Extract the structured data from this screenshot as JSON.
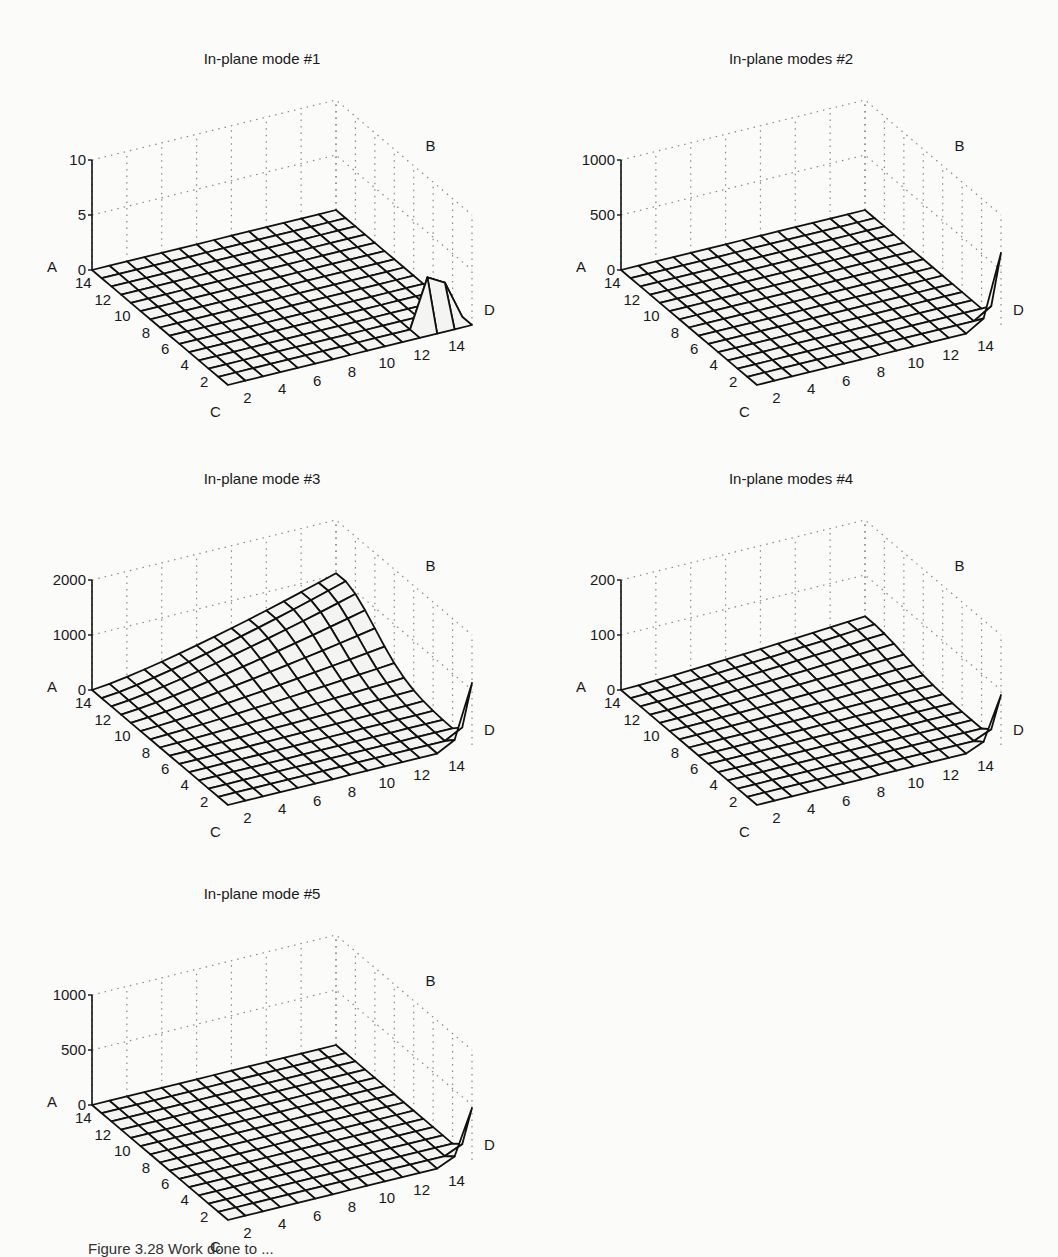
{
  "figure": {
    "caption": "Figure 3.28  Work done to ..."
  },
  "chart_data": [
    {
      "type": "surface",
      "title": "In-plane mode #1",
      "axes": {
        "corner_labels": [
          "A",
          "B",
          "C",
          "D"
        ],
        "x_ticks": [
          2,
          4,
          6,
          8,
          10,
          12,
          14
        ],
        "y_ticks": [
          2,
          4,
          6,
          8,
          10,
          12,
          14
        ],
        "z_ticks": [
          0,
          5,
          10
        ],
        "zlim": [
          0,
          10
        ]
      },
      "grid_size": 15,
      "surface": "flat ~0 everywhere; sharp triangular peak (~4) near x=12-13, y=13-14 (corner D)",
      "peak": {
        "x": 12.5,
        "y": 13,
        "z": 4
      },
      "grid": "dotted"
    },
    {
      "type": "surface",
      "title": "In-plane modes #2",
      "axes": {
        "corner_labels": [
          "A",
          "B",
          "C",
          "D"
        ],
        "x_ticks": [
          2,
          4,
          6,
          8,
          10,
          12,
          14
        ],
        "y_ticks": [
          2,
          4,
          6,
          8,
          10,
          12,
          14
        ],
        "z_ticks": [
          0,
          500,
          1000
        ],
        "zlim": [
          0,
          1000
        ]
      },
      "grid_size": 15,
      "surface": "flat ~0; single thin spike (~450) at corner x=14, y=14",
      "peak": {
        "x": 14,
        "y": 14,
        "z": 450
      },
      "grid": "dotted"
    },
    {
      "type": "surface",
      "title": "In-plane mode #3",
      "axes": {
        "corner_labels": [
          "A",
          "B",
          "C",
          "D"
        ],
        "x_ticks": [
          2,
          4,
          6,
          8,
          10,
          12,
          14
        ],
        "y_ticks": [
          2,
          4,
          6,
          8,
          10,
          12,
          14
        ],
        "z_ticks": [
          0,
          1000,
          2000
        ],
        "zlim": [
          0,
          2000
        ]
      },
      "grid_size": 15,
      "surface": "smooth hump rising toward B edge (~600) with ridge ~800 near back corner; spike (~900) at corner D",
      "peak": {
        "x": 14,
        "y": 14,
        "z": 900
      },
      "grid": "dotted"
    },
    {
      "type": "surface",
      "title": "In-plane modes #4",
      "axes": {
        "corner_labels": [
          "A",
          "B",
          "C",
          "D"
        ],
        "x_ticks": [
          2,
          4,
          6,
          8,
          10,
          12,
          14
        ],
        "y_ticks": [
          2,
          4,
          6,
          8,
          10,
          12,
          14
        ],
        "z_ticks": [
          0,
          100,
          200
        ],
        "zlim": [
          0,
          200
        ]
      },
      "grid_size": 15,
      "surface": "nearly flat; mild hump near B (~20); spike (~50) at corner D",
      "peak": {
        "x": 14,
        "y": 14,
        "z": 50
      },
      "grid": "dotted"
    },
    {
      "type": "surface",
      "title": "In-plane mode #5",
      "axes": {
        "corner_labels": [
          "A",
          "B",
          "C",
          "D"
        ],
        "x_ticks": [
          2,
          4,
          6,
          8,
          10,
          12,
          14
        ],
        "y_ticks": [
          2,
          4,
          6,
          8,
          10,
          12,
          14
        ],
        "z_ticks": [
          0,
          500,
          1000
        ],
        "zlim": [
          0,
          1000
        ]
      },
      "grid_size": 15,
      "surface": "flat ~0; spike (~500) at corner D",
      "peak": {
        "x": 14,
        "y": 14,
        "z": 500
      },
      "grid": "dotted"
    }
  ],
  "panels": [
    {
      "title": "In-plane mode #1",
      "z_ticks": [
        "0",
        "5",
        "10"
      ],
      "peak_type": "tent",
      "peak_h": 48,
      "hump": 0
    },
    {
      "title": "In-plane modes #2",
      "z_ticks": [
        "0",
        "500",
        "1000"
      ],
      "peak_type": "spike",
      "peak_h": 72,
      "hump": 0
    },
    {
      "title": "In-plane mode #3",
      "z_ticks": [
        "0",
        "1000",
        "2000"
      ],
      "peak_type": "spike",
      "peak_h": 62,
      "hump": 58
    },
    {
      "title": "In-plane modes #4",
      "z_ticks": [
        "0",
        "100",
        "200"
      ],
      "peak_type": "spike",
      "peak_h": 50,
      "hump": 14
    },
    {
      "title": "In-plane mode #5",
      "z_ticks": [
        "0",
        "500",
        "1000"
      ],
      "peak_type": "spike",
      "peak_h": 52,
      "hump": 0
    }
  ],
  "ticks": [
    "2",
    "4",
    "6",
    "8",
    "10",
    "12",
    "14"
  ],
  "corners": {
    "a": "A",
    "b": "B",
    "c": "C",
    "d": "D"
  }
}
